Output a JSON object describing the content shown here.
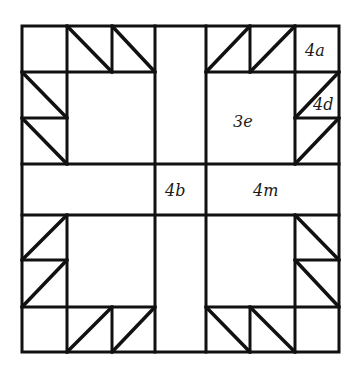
{
  "diagram": {
    "type": "quilt-block-pattern",
    "line_color": "#111111",
    "background": "#ffffff",
    "grid": {
      "columns_x": [
        22,
        67,
        112,
        155,
        206,
        250,
        295,
        339
      ],
      "rows_y": [
        26,
        72,
        118,
        164,
        215,
        260,
        307,
        352
      ]
    },
    "labels": {
      "a": "4a",
      "d": "4d",
      "e": "3e",
      "b": "4b",
      "m": "4m"
    }
  }
}
